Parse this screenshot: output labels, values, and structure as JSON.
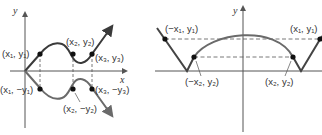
{
  "left_figure": {
    "axis_labels": {
      "x": "x",
      "y": "y"
    },
    "points": [
      {
        "id": "p1",
        "label": "(x₁, y₁)"
      },
      {
        "id": "p2",
        "label": "(x₂, y₂)"
      },
      {
        "id": "p3",
        "label": "(x₃, y₃)"
      },
      {
        "id": "p1m",
        "label": "(x₁, −y₁)"
      },
      {
        "id": "p2m",
        "label": "(x₂, −y₂)"
      },
      {
        "id": "p3m",
        "label": "(x₃, −y₃)"
      }
    ]
  },
  "right_figure": {
    "axis_labels": {
      "y": "y"
    },
    "points": [
      {
        "id": "q1m",
        "label": "(−x₁, y₁)"
      },
      {
        "id": "q1",
        "label": "(x₁, y₁)"
      },
      {
        "id": "q2m",
        "label": "(−x₂, y₂)"
      },
      {
        "id": "q2",
        "label": "(x₂, y₂)"
      }
    ]
  },
  "colors": {
    "curve_top": "#3a3a3a",
    "curve_bottom": "#6a6a6a",
    "axis": "#555555",
    "dash": "#555555",
    "point": "#111111",
    "text": "#333333"
  }
}
